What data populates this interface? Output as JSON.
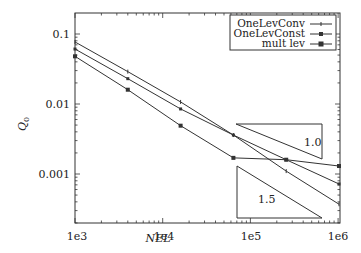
{
  "chart_data": {
    "type": "line",
    "title": "",
    "xlabel": "NEL",
    "ylabel": "Q_0",
    "xscale": "log",
    "yscale": "log",
    "xlim": [
      1000,
      1100000
    ],
    "ylim": [
      0.0002,
      0.2
    ],
    "x_ticks": [
      "1e3",
      "1e4",
      "1e5",
      "1e6"
    ],
    "y_ticks": [
      "0.1",
      "0.01",
      "0.001"
    ],
    "grid": false,
    "legend_position": "upper right",
    "x": [
      1000,
      4000,
      16000,
      64000,
      256000,
      1024000
    ],
    "series": [
      {
        "name": "OneLevConv",
        "marker": "+",
        "values": [
          0.077,
          0.029,
          0.0107,
          0.0036,
          0.0011,
          0.00037
        ]
      },
      {
        "name": "OneLevConst",
        "marker": "square",
        "values": [
          0.061,
          0.023,
          0.0085,
          0.0036,
          0.0016,
          0.00072
        ]
      },
      {
        "name": "mult lev",
        "marker": "x-square",
        "values": [
          0.048,
          0.016,
          0.0049,
          0.0017,
          0.0016,
          0.0013
        ]
      }
    ],
    "annotations": [
      {
        "type": "slope-triangle",
        "label": "1.0"
      },
      {
        "type": "slope-triangle",
        "label": "1.5"
      }
    ]
  },
  "labels": {
    "xlabel": "NEL",
    "ylabel_main": "Q",
    "ylabel_sub": "0",
    "xticks": [
      "1e3",
      "1e4",
      "1e5",
      "1e6"
    ],
    "yticks": [
      "0.1",
      "0.01",
      "0.001"
    ],
    "legend": [
      "OneLevConv",
      "OneLevConst",
      "mult lev"
    ],
    "tri1": "1.0",
    "tri2": "1.5"
  }
}
